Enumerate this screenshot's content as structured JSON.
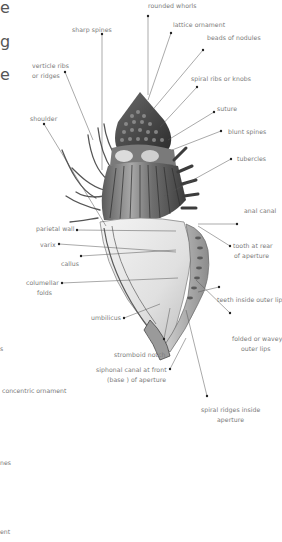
{
  "diagram": {
    "edge_fragments_left": [
      {
        "text": "e",
        "x": 0,
        "y": 3
      },
      {
        "text": "g",
        "x": 0,
        "y": 37
      },
      {
        "text": "e",
        "x": 0,
        "y": 70
      },
      {
        "text": "s",
        "x": 0,
        "y": 348
      },
      {
        "text": "concentric ornament",
        "x": 2,
        "y": 390
      },
      {
        "text": "nes",
        "x": 0,
        "y": 460
      },
      {
        "text": "ent",
        "x": 0,
        "y": 530
      }
    ],
    "labels": {
      "rounded_whorls": "rounded whorls",
      "sharp_spines": "sharp spines",
      "lattice_ornament": "lattice ornament",
      "beads_of_nodules": "beads of nodules",
      "verticle_ribs_l1": "verticle ribs",
      "verticle_ribs_l2": "or ridges",
      "spiral_ribs": "spiral ribs or knobs",
      "shoulder": "shoulder",
      "suture": "suture",
      "blunt_spines": "blunt spines",
      "tubercles": "tubercles",
      "anal_canal": "anal canal",
      "parietal_wall": "parietal wall",
      "tooth_l1": "tooth at rear",
      "tooth_l2": "of aperture",
      "varix": "varix",
      "callus": "callus",
      "columellar_l1": "columellar",
      "columellar_l2": "folds",
      "teeth_outer_lip": "teeth inside outer lip",
      "umbilicus": "umbilicus",
      "folded_l1": "folded or wavey",
      "folded_l2": "outer lips",
      "stromboid_notch": "stromboid notch",
      "siphonal_l1": "siphonal canal at front",
      "siphonal_l2": "(base ) of aperture",
      "spiral_ridges_l1": "spiral ridges inside",
      "spiral_ridges_l2": "aperture"
    },
    "colors": {
      "background": "#ffffff",
      "label_text": "#7a7a7a",
      "leader_line": "#555555",
      "shell_dark": "#3a3a3a",
      "shell_mid": "#8a8a8a",
      "shell_light": "#e6e6e6"
    }
  }
}
